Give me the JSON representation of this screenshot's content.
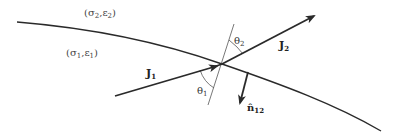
{
  "diagram": {
    "colors": {
      "stroke": "#2a2a2a",
      "normal_line": "#555555",
      "text": "#333333",
      "background": "#ffffff"
    },
    "media": {
      "upper": {
        "label": "(σ2,ε2)",
        "sigma": "σ",
        "sigma_sub": "2",
        "eps": "ε",
        "eps_sub": "2"
      },
      "lower": {
        "label": "(σ1,ε1)",
        "sigma": "σ",
        "sigma_sub": "1",
        "eps": "ε",
        "eps_sub": "1"
      }
    },
    "vectors": {
      "incident": {
        "label": "J",
        "sub": "1",
        "full": "J1"
      },
      "refracted": {
        "label": "J",
        "sub": "2",
        "full": "J2"
      },
      "normal": {
        "label": "n̂",
        "sub": "12",
        "full": "n̂12"
      }
    },
    "angles": {
      "theta1": {
        "label": "θ",
        "sub": "1"
      },
      "theta2": {
        "label": "θ",
        "sub": "2"
      }
    },
    "nodes": [
      "boundary-curve",
      "normal-line",
      "J1-arrow",
      "J2-arrow",
      "n12-arrow",
      "theta1-arc",
      "theta2-arc"
    ],
    "edges": [
      {
        "from": "J1-arrow",
        "to": "interface-point",
        "meaning": "incident current density"
      },
      {
        "from": "interface-point",
        "to": "J2-arrow",
        "meaning": "refracted current density"
      },
      {
        "from": "interface-point",
        "to": "n12-arrow",
        "meaning": "unit normal from medium 1 to 2"
      }
    ]
  }
}
